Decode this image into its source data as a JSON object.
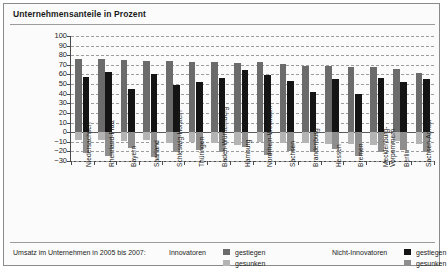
{
  "header": {
    "title": "Unternehmensanteile in Prozent"
  },
  "legend": {
    "caption": "Umsatz im Unternehmen in 2005 bis 2007:",
    "groups": [
      {
        "name": "Innovatoren",
        "entries": [
          {
            "label": "gestiegen",
            "color": "#6b6b6b"
          },
          {
            "label": "gesunken",
            "color": "#b4b4b4"
          }
        ]
      },
      {
        "name": "Nicht-Innovatoren",
        "entries": [
          {
            "label": "gestiegen",
            "color": "#141414"
          },
          {
            "label": "gesunken",
            "color": "#8e8e8e"
          }
        ]
      }
    ]
  },
  "chart_data": {
    "type": "bar",
    "title": "Unternehmensanteile in Prozent",
    "xlabel": "",
    "ylabel": "",
    "ylim": [
      -30,
      100
    ],
    "yticks": [
      100,
      90,
      80,
      70,
      60,
      50,
      40,
      30,
      20,
      10,
      0,
      "−10",
      "−20",
      "−30"
    ],
    "ytick_values": [
      100,
      90,
      80,
      70,
      60,
      50,
      40,
      30,
      20,
      10,
      0,
      -10,
      -20,
      -30
    ],
    "grid": true,
    "legend_position": "bottom",
    "categories": [
      "Niedersachsen",
      "Rheinland-Pfalz",
      "Bayern",
      "Saarland",
      "Schleswig-Holstein",
      "Thüringen",
      "Baden-Württemberg",
      "Hamburg",
      "Nordrhein-Westfalen",
      "Sachsen",
      "Brandenburg",
      "Hessen",
      "Bremen",
      "Mecklenburg-Vorpommern",
      "Berlin",
      "Sachsen-Anhalt"
    ],
    "series": [
      {
        "name": "Innovatoren gestiegen",
        "color": "#6b6b6b",
        "values": [
          76,
          76,
          75,
          74,
          74,
          73,
          73,
          72,
          73,
          71,
          69,
          69,
          68,
          68,
          66,
          62
        ]
      },
      {
        "name": "Nicht-Innovatoren gestiegen",
        "color": "#141414",
        "values": [
          57,
          63,
          45,
          60,
          49,
          52,
          56,
          65,
          59,
          53,
          42,
          55,
          40,
          56,
          52,
          55
        ]
      },
      {
        "name": "Innovatoren gesunken",
        "color": "#b4b4b4",
        "values": [
          -8,
          -8,
          -9,
          -8,
          -11,
          -10,
          -11,
          -13,
          -10,
          -11,
          -11,
          -12,
          -12,
          -13,
          -9,
          -12
        ]
      },
      {
        "name": "Nicht-Innovatoren gesunken",
        "color": "#8e8e8e",
        "values": [
          -22,
          -25,
          -17,
          -26,
          -21,
          -19,
          -21,
          -15,
          -24,
          -20,
          -21,
          -18,
          -25,
          -21,
          -19,
          -21
        ]
      }
    ]
  }
}
